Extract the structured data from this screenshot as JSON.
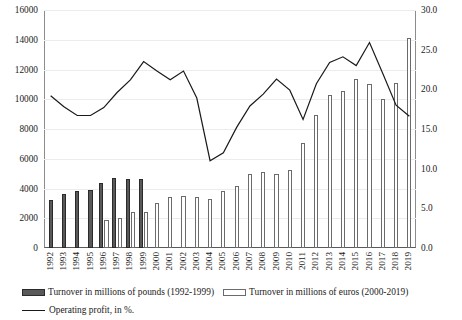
{
  "chart_data": {
    "type": "bar",
    "title": "",
    "xlabel": "",
    "ylabel": "",
    "y2label": "",
    "grid": true,
    "legend_position": "bottom",
    "categories": [
      "1992",
      "1993",
      "1994",
      "1995",
      "1996",
      "1997",
      "1998",
      "1999",
      "2000",
      "2001",
      "2002",
      "2003",
      "2004",
      "2005",
      "2006",
      "2007",
      "2008",
      "2009",
      "2010",
      "2011",
      "2012",
      "2013",
      "2014",
      "2015",
      "2016",
      "2017",
      "2018",
      "2019"
    ],
    "ylim": [
      0,
      16000
    ],
    "yticks": [
      "0",
      "2000",
      "4000",
      "6000",
      "8000",
      "10000",
      "12000",
      "14000",
      "16000"
    ],
    "y2lim": [
      0,
      30
    ],
    "y2ticks": [
      "0.0",
      "5.0",
      "10.0",
      "15.0",
      "20.0",
      "25.0",
      "30.0"
    ],
    "series": [
      {
        "name": "Turnover in millions of pounds (1992-1999)",
        "type": "bar",
        "axis": "left",
        "color": "#595959",
        "values": [
          3200,
          3600,
          3800,
          3900,
          4400,
          4700,
          4650,
          4650,
          null,
          null,
          null,
          null,
          null,
          null,
          null,
          null,
          null,
          null,
          null,
          null,
          null,
          null,
          null,
          null,
          null,
          null,
          null,
          null
        ]
      },
      {
        "name": "Turnover in millions of euros (2000-2019)",
        "type": "bar",
        "axis": "left",
        "color": "#ffffff",
        "values": [
          null,
          null,
          null,
          null,
          1900,
          2000,
          2400,
          2450,
          3000,
          3400,
          3500,
          3400,
          3300,
          3800,
          4200,
          5000,
          5100,
          5000,
          5250,
          7050,
          8950,
          10300,
          10550,
          11350,
          11050,
          10000,
          11100,
          14150
        ]
      },
      {
        "name": "Operating profit, in %.",
        "type": "line",
        "axis": "right",
        "color": "#1a1a1a",
        "values": [
          19.2,
          17.8,
          16.7,
          16.7,
          17.7,
          19.6,
          21.2,
          23.5,
          22.3,
          21.2,
          22.3,
          18.9,
          11.0,
          12.0,
          15.2,
          17.9,
          19.4,
          21.3,
          19.9,
          16.2,
          20.7,
          23.4,
          24.1,
          23.0,
          25.9,
          22.0,
          18.0,
          16.6
        ]
      }
    ]
  },
  "legend": {
    "items": [
      {
        "key": "pounds",
        "label": "Turnover in millions of pounds (1992-1999)"
      },
      {
        "key": "euros",
        "label": "Turnover in millions of euros (2000-2019)"
      },
      {
        "key": "line",
        "label": "Operating profit, in %."
      }
    ]
  }
}
